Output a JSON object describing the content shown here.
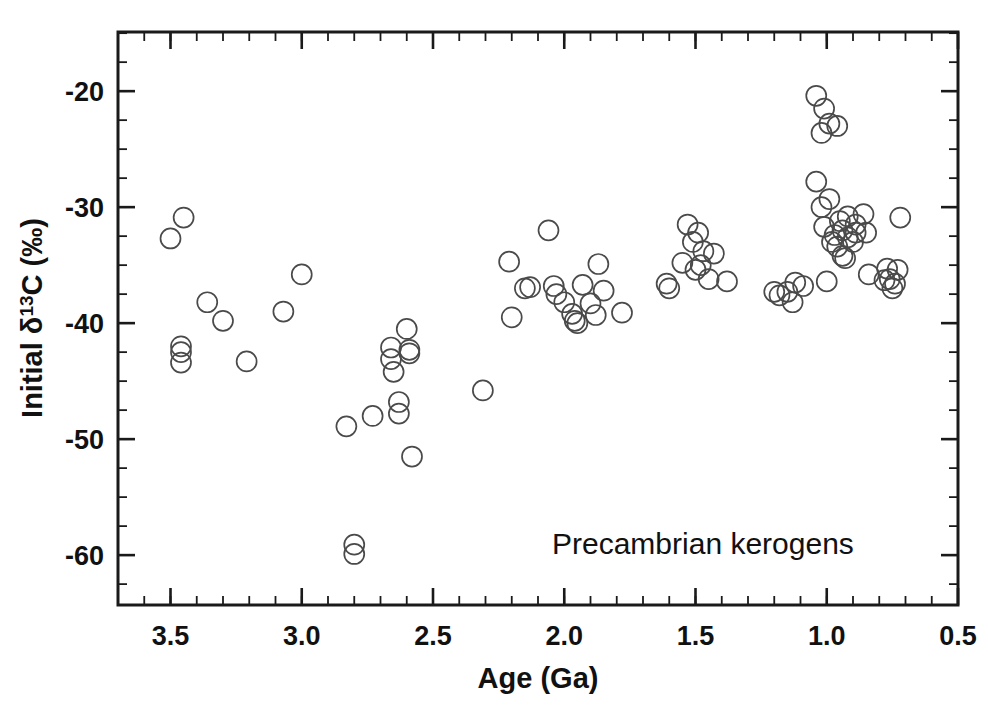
{
  "chart_data": {
    "type": "scatter",
    "title": "",
    "annotation": "Precambrian kerogens",
    "xlabel": "Age (Ga)",
    "ylabel_parts": {
      "pre": "Initial ",
      "delta": "δ",
      "sup": "13",
      "post": "C (‰)"
    },
    "ylabel": "Initial δ13C (‰)",
    "xlim": [
      3.7,
      0.5
    ],
    "ylim": [
      -64.3,
      -14.9
    ],
    "x_reversed": true,
    "grid": false,
    "legend": "none",
    "xticks_major": [
      3.5,
      3.0,
      2.5,
      2.0,
      1.5,
      1.0,
      0.5
    ],
    "xticks_major_labels": [
      "3.5",
      "3.0",
      "2.5",
      "2.0",
      "1.5",
      "1.0",
      "0.5"
    ],
    "xtick_minor_step": 0.1,
    "yticks_major": [
      -20,
      -30,
      -40,
      -50,
      -60
    ],
    "yticks_major_labels": [
      "-20",
      "-30",
      "-40",
      "-50",
      "-60"
    ],
    "ytick_minor_step": 2.5,
    "marker": {
      "shape": "circle-open",
      "radius_px": 10,
      "stroke": "#4a4a4a"
    },
    "series": [
      {
        "name": "Precambrian kerogens",
        "points": [
          [
            3.5,
            -32.7
          ],
          [
            3.45,
            -30.9
          ],
          [
            3.46,
            -42.0
          ],
          [
            3.46,
            -42.5
          ],
          [
            3.46,
            -43.4
          ],
          [
            3.36,
            -38.2
          ],
          [
            3.3,
            -39.8
          ],
          [
            3.21,
            -43.3
          ],
          [
            3.07,
            -39.0
          ],
          [
            3.0,
            -35.8
          ],
          [
            2.83,
            -48.9
          ],
          [
            2.8,
            -59.1
          ],
          [
            2.8,
            -59.9
          ],
          [
            2.73,
            -48.0
          ],
          [
            2.66,
            -43.1
          ],
          [
            2.66,
            -42.1
          ],
          [
            2.65,
            -44.2
          ],
          [
            2.63,
            -47.8
          ],
          [
            2.63,
            -46.8
          ],
          [
            2.6,
            -40.5
          ],
          [
            2.59,
            -42.3
          ],
          [
            2.59,
            -42.6
          ],
          [
            2.58,
            -51.5
          ],
          [
            2.31,
            -45.8
          ],
          [
            2.21,
            -34.7
          ],
          [
            2.2,
            -39.5
          ],
          [
            2.15,
            -37.0
          ],
          [
            2.13,
            -36.9
          ],
          [
            2.06,
            -32.0
          ],
          [
            2.04,
            -36.8
          ],
          [
            2.03,
            -37.5
          ],
          [
            2.0,
            -38.2
          ],
          [
            1.97,
            -39.2
          ],
          [
            1.96,
            -39.8
          ],
          [
            1.95,
            -40.0
          ],
          [
            1.93,
            -36.7
          ],
          [
            1.9,
            -38.3
          ],
          [
            1.88,
            -39.3
          ],
          [
            1.87,
            -34.9
          ],
          [
            1.85,
            -37.2
          ],
          [
            1.78,
            -39.1
          ],
          [
            1.61,
            -36.6
          ],
          [
            1.6,
            -37.0
          ],
          [
            1.55,
            -34.8
          ],
          [
            1.53,
            -31.5
          ],
          [
            1.51,
            -33.0
          ],
          [
            1.5,
            -35.4
          ],
          [
            1.49,
            -32.2
          ],
          [
            1.48,
            -35.0
          ],
          [
            1.47,
            -33.8
          ],
          [
            1.45,
            -36.2
          ],
          [
            1.43,
            -34.0
          ],
          [
            1.38,
            -36.4
          ],
          [
            1.15,
            -37.3
          ],
          [
            1.13,
            -38.2
          ],
          [
            1.04,
            -20.4
          ],
          [
            1.02,
            -23.6
          ],
          [
            1.01,
            -21.5
          ],
          [
            0.99,
            -22.8
          ],
          [
            1.04,
            -27.8
          ],
          [
            1.02,
            -30.0
          ],
          [
            1.01,
            -31.7
          ],
          [
            0.99,
            -29.3
          ],
          [
            0.98,
            -33.0
          ],
          [
            0.97,
            -32.4
          ],
          [
            0.96,
            -33.4
          ],
          [
            0.95,
            -31.2
          ],
          [
            0.94,
            -32.0
          ],
          [
            0.94,
            -34.2
          ],
          [
            0.93,
            -34.4
          ],
          [
            0.92,
            -32.6
          ],
          [
            0.92,
            -30.8
          ],
          [
            0.9,
            -33.0
          ],
          [
            0.89,
            -31.5
          ],
          [
            0.89,
            -32.2
          ],
          [
            0.96,
            -23.0
          ],
          [
            1.09,
            -36.8
          ],
          [
            1.0,
            -36.4
          ],
          [
            0.86,
            -30.6
          ],
          [
            0.85,
            -32.2
          ],
          [
            0.84,
            -35.8
          ],
          [
            0.78,
            -36.3
          ],
          [
            0.77,
            -35.3
          ],
          [
            0.76,
            -36.2
          ],
          [
            0.75,
            -37.0
          ],
          [
            0.74,
            -36.6
          ],
          [
            0.73,
            -35.4
          ],
          [
            0.72,
            -30.9
          ],
          [
            1.18,
            -37.6
          ],
          [
            1.2,
            -37.3
          ],
          [
            1.12,
            -36.5
          ]
        ]
      }
    ]
  },
  "axes": {
    "x_title": "Age (Ga)",
    "y_title": "Initial δ13C (‰)"
  }
}
